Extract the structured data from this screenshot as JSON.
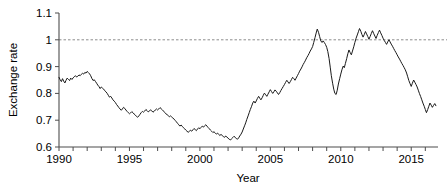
{
  "chart_data": {
    "type": "line",
    "title": "",
    "subtitle": "",
    "xlabel": "Year",
    "ylabel": "Exchange rate",
    "xlim": [
      1990,
      2016.9
    ],
    "ylim": [
      0.6,
      1.1
    ],
    "grid": false,
    "legend": null,
    "xticks": [
      1990,
      1991,
      1992,
      1993,
      1994,
      1995,
      1996,
      1997,
      1998,
      1999,
      2000,
      2001,
      2002,
      2003,
      2004,
      2005,
      2006,
      2007,
      2008,
      2009,
      2010,
      2011,
      2012,
      2013,
      2014,
      2015,
      2016
    ],
    "xtick_labels": [
      "1990",
      "",
      "",
      "",
      "",
      "1995",
      "",
      "",
      "",
      "",
      "2000",
      "",
      "",
      "",
      "",
      "2005",
      "",
      "",
      "",
      "",
      "2010",
      "",
      "",
      "",
      "",
      "2015",
      ""
    ],
    "yticks": [
      0.6,
      0.7,
      0.8,
      0.9,
      1.0,
      1.1
    ],
    "ytick_labels": [
      "0.6",
      "0.7",
      "0.8",
      "0.9",
      "1",
      "1.1"
    ],
    "annotations": [
      {
        "name": "parity-reference-line",
        "type": "hline",
        "y": 1.0,
        "style": "dashed",
        "color": "#8c8c8c"
      }
    ],
    "series": [
      {
        "name": "exchange-rate",
        "color": "#1a1a1a",
        "x": [
          1990.0,
          1990.08,
          1990.17,
          1990.25,
          1990.33,
          1990.42,
          1990.5,
          1990.58,
          1990.67,
          1990.75,
          1990.83,
          1990.92,
          1991.0,
          1991.08,
          1991.17,
          1991.25,
          1991.33,
          1991.42,
          1991.5,
          1991.58,
          1991.67,
          1991.75,
          1991.83,
          1991.92,
          1992.0,
          1992.08,
          1992.17,
          1992.25,
          1992.33,
          1992.42,
          1992.5,
          1992.58,
          1992.67,
          1992.75,
          1992.83,
          1992.92,
          1993.0,
          1993.08,
          1993.17,
          1993.25,
          1993.33,
          1993.42,
          1993.5,
          1993.58,
          1993.67,
          1993.75,
          1993.83,
          1993.92,
          1994.0,
          1994.08,
          1994.17,
          1994.25,
          1994.33,
          1994.42,
          1994.5,
          1994.58,
          1994.67,
          1994.75,
          1994.83,
          1994.92,
          1995.0,
          1995.08,
          1995.17,
          1995.25,
          1995.33,
          1995.42,
          1995.5,
          1995.58,
          1995.67,
          1995.75,
          1995.83,
          1995.92,
          1996.0,
          1996.08,
          1996.17,
          1996.25,
          1996.33,
          1996.42,
          1996.5,
          1996.58,
          1996.67,
          1996.75,
          1996.83,
          1996.92,
          1997.0,
          1997.08,
          1997.17,
          1997.25,
          1997.33,
          1997.42,
          1997.5,
          1997.58,
          1997.67,
          1997.75,
          1997.83,
          1997.92,
          1998.0,
          1998.08,
          1998.17,
          1998.25,
          1998.33,
          1998.42,
          1998.5,
          1998.58,
          1998.67,
          1998.75,
          1998.83,
          1998.92,
          1999.0,
          1999.08,
          1999.17,
          1999.25,
          1999.33,
          1999.42,
          1999.5,
          1999.58,
          1999.67,
          1999.75,
          1999.83,
          1999.92,
          2000.0,
          2000.08,
          2000.17,
          2000.25,
          2000.33,
          2000.42,
          2000.5,
          2000.58,
          2000.67,
          2000.75,
          2000.83,
          2000.92,
          2001.0,
          2001.08,
          2001.17,
          2001.25,
          2001.33,
          2001.42,
          2001.5,
          2001.58,
          2001.67,
          2001.75,
          2001.83,
          2001.92,
          2002.0,
          2002.08,
          2002.17,
          2002.25,
          2002.33,
          2002.42,
          2002.5,
          2002.58,
          2002.67,
          2002.75,
          2002.83,
          2002.92,
          2003.0,
          2003.08,
          2003.17,
          2003.25,
          2003.33,
          2003.42,
          2003.5,
          2003.58,
          2003.67,
          2003.75,
          2003.83,
          2003.92,
          2004.0,
          2004.08,
          2004.17,
          2004.25,
          2004.33,
          2004.42,
          2004.5,
          2004.58,
          2004.67,
          2004.75,
          2004.83,
          2004.92,
          2005.0,
          2005.08,
          2005.17,
          2005.25,
          2005.33,
          2005.42,
          2005.5,
          2005.58,
          2005.67,
          2005.75,
          2005.83,
          2005.92,
          2006.0,
          2006.08,
          2006.17,
          2006.25,
          2006.33,
          2006.42,
          2006.5,
          2006.58,
          2006.67,
          2006.75,
          2006.83,
          2006.92,
          2007.0,
          2007.08,
          2007.17,
          2007.25,
          2007.33,
          2007.42,
          2007.5,
          2007.58,
          2007.67,
          2007.75,
          2007.83,
          2007.92,
          2008.0,
          2008.08,
          2008.17,
          2008.25,
          2008.33,
          2008.42,
          2008.5,
          2008.58,
          2008.67,
          2008.75,
          2008.83,
          2008.92,
          2009.0,
          2009.08,
          2009.17,
          2009.25,
          2009.33,
          2009.42,
          2009.5,
          2009.58,
          2009.67,
          2009.75,
          2009.83,
          2009.92,
          2010.0,
          2010.08,
          2010.17,
          2010.25,
          2010.33,
          2010.42,
          2010.5,
          2010.58,
          2010.67,
          2010.75,
          2010.83,
          2010.92,
          2011.0,
          2011.08,
          2011.17,
          2011.25,
          2011.33,
          2011.42,
          2011.5,
          2011.58,
          2011.67,
          2011.75,
          2011.83,
          2011.92,
          2012.0,
          2012.08,
          2012.17,
          2012.25,
          2012.33,
          2012.42,
          2012.5,
          2012.58,
          2012.67,
          2012.75,
          2012.83,
          2012.92,
          2013.0,
          2013.08,
          2013.17,
          2013.25,
          2013.33,
          2013.42,
          2013.5,
          2013.58,
          2013.67,
          2013.75,
          2013.83,
          2013.92,
          2014.0,
          2014.08,
          2014.17,
          2014.25,
          2014.33,
          2014.42,
          2014.5,
          2014.58,
          2014.67,
          2014.75,
          2014.83,
          2014.92,
          2015.0,
          2015.08,
          2015.17,
          2015.25,
          2015.33,
          2015.42,
          2015.5,
          2015.58,
          2015.67,
          2015.75,
          2015.83,
          2015.92,
          2016.0,
          2016.08,
          2016.17,
          2016.25,
          2016.33,
          2016.42,
          2016.5,
          2016.58,
          2016.67,
          2016.75
        ],
        "y": [
          0.86,
          0.851,
          0.844,
          0.855,
          0.846,
          0.839,
          0.849,
          0.857,
          0.852,
          0.848,
          0.857,
          0.852,
          0.858,
          0.862,
          0.866,
          0.861,
          0.864,
          0.869,
          0.866,
          0.871,
          0.875,
          0.872,
          0.878,
          0.876,
          0.882,
          0.878,
          0.873,
          0.866,
          0.856,
          0.848,
          0.851,
          0.845,
          0.838,
          0.831,
          0.826,
          0.818,
          0.824,
          0.82,
          0.816,
          0.81,
          0.806,
          0.8,
          0.793,
          0.786,
          0.789,
          0.783,
          0.776,
          0.771,
          0.766,
          0.759,
          0.753,
          0.747,
          0.742,
          0.737,
          0.742,
          0.748,
          0.744,
          0.738,
          0.733,
          0.728,
          0.724,
          0.727,
          0.732,
          0.728,
          0.723,
          0.719,
          0.714,
          0.711,
          0.716,
          0.722,
          0.728,
          0.733,
          0.73,
          0.734,
          0.74,
          0.736,
          0.731,
          0.734,
          0.739,
          0.735,
          0.73,
          0.733,
          0.738,
          0.742,
          0.738,
          0.742,
          0.747,
          0.743,
          0.739,
          0.734,
          0.729,
          0.724,
          0.721,
          0.717,
          0.713,
          0.716,
          0.712,
          0.708,
          0.704,
          0.699,
          0.694,
          0.688,
          0.683,
          0.678,
          0.682,
          0.677,
          0.672,
          0.668,
          0.663,
          0.659,
          0.655,
          0.658,
          0.663,
          0.659,
          0.664,
          0.669,
          0.665,
          0.661,
          0.667,
          0.672,
          0.668,
          0.673,
          0.678,
          0.674,
          0.679,
          0.683,
          0.678,
          0.673,
          0.668,
          0.663,
          0.659,
          0.654,
          0.657,
          0.653,
          0.648,
          0.652,
          0.647,
          0.643,
          0.647,
          0.643,
          0.639,
          0.636,
          0.641,
          0.637,
          0.633,
          0.629,
          0.626,
          0.631,
          0.635,
          0.64,
          0.636,
          0.632,
          0.629,
          0.634,
          0.641,
          0.648,
          0.656,
          0.667,
          0.679,
          0.69,
          0.703,
          0.716,
          0.728,
          0.74,
          0.752,
          0.764,
          0.771,
          0.764,
          0.772,
          0.781,
          0.789,
          0.782,
          0.776,
          0.784,
          0.793,
          0.801,
          0.795,
          0.789,
          0.797,
          0.806,
          0.814,
          0.807,
          0.8,
          0.806,
          0.813,
          0.808,
          0.802,
          0.796,
          0.803,
          0.811,
          0.818,
          0.826,
          0.833,
          0.841,
          0.849,
          0.843,
          0.837,
          0.844,
          0.852,
          0.86,
          0.855,
          0.849,
          0.857,
          0.866,
          0.874,
          0.883,
          0.891,
          0.899,
          0.908,
          0.916,
          0.924,
          0.933,
          0.941,
          0.949,
          0.958,
          0.966,
          0.975,
          0.99,
          1.008,
          1.025,
          1.04,
          1.028,
          1.012,
          0.996,
          0.99,
          0.996,
          0.99,
          0.982,
          0.972,
          0.956,
          0.93,
          0.898,
          0.866,
          0.838,
          0.816,
          0.8,
          0.796,
          0.812,
          0.835,
          0.855,
          0.872,
          0.888,
          0.902,
          0.896,
          0.912,
          0.93,
          0.948,
          0.962,
          0.952,
          0.944,
          0.958,
          0.974,
          0.99,
          1.005,
          1.018,
          1.03,
          1.042,
          1.032,
          1.02,
          1.01,
          1.02,
          1.031,
          1.022,
          1.012,
          1.002,
          1.012,
          1.024,
          1.034,
          1.024,
          1.014,
          1.005,
          1.016,
          1.027,
          1.036,
          1.026,
          1.016,
          1.006,
          0.998,
          0.99,
          0.983,
          0.992,
          1.0,
          0.992,
          0.984,
          0.976,
          0.968,
          0.96,
          0.952,
          0.944,
          0.936,
          0.928,
          0.92,
          0.912,
          0.904,
          0.896,
          0.888,
          0.876,
          0.862,
          0.848,
          0.836,
          0.826,
          0.838,
          0.85,
          0.842,
          0.834,
          0.824,
          0.812,
          0.8,
          0.788,
          0.776,
          0.764,
          0.752,
          0.74,
          0.728,
          0.74,
          0.752,
          0.764,
          0.756,
          0.748,
          0.755,
          0.762,
          0.754
        ]
      }
    ]
  }
}
